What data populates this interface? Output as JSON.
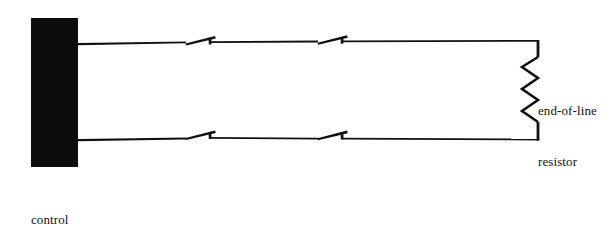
{
  "diagram": {
    "background_color": "#ffffff",
    "ink_color": "#111111",
    "panel_fill": "#0d0d0d"
  },
  "control_panel": {
    "label_line1": "control",
    "label_line2": "panel",
    "shape": "filled-rectangle"
  },
  "resistor": {
    "label_line1": "end-of-line",
    "label_line2": "resistor",
    "symbol": "zigzag"
  },
  "wires": {
    "top_run_label": "top supervised loop conductor",
    "bottom_run_label": "bottom supervised loop conductor"
  },
  "switches": [
    {
      "name": "top-switch-1",
      "position": "top-left"
    },
    {
      "name": "top-switch-2",
      "position": "top-right"
    },
    {
      "name": "bottom-switch-1",
      "position": "bottom-left"
    },
    {
      "name": "bottom-switch-2",
      "position": "bottom-right"
    }
  ]
}
